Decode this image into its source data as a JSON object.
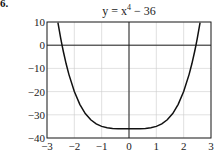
{
  "figure": {
    "label": "6.",
    "title_prefix": "y = x",
    "title_exponent": "4",
    "title_suffix": " − 36"
  },
  "chart_data": {
    "type": "line",
    "xlabel": "",
    "ylabel": "",
    "xlim": [
      -3,
      3
    ],
    "ylim": [
      -40,
      10
    ],
    "xticks": [
      -3,
      -2,
      -1,
      0,
      1,
      2,
      3
    ],
    "yticks": [
      10,
      0,
      -10,
      -20,
      -30,
      -40
    ],
    "xtick_labels": [
      "−3",
      "−2",
      "−1",
      "0",
      "1",
      "2",
      "3"
    ],
    "ytick_labels": [
      "10",
      "0",
      "−10",
      "−20",
      "−30",
      "−40"
    ],
    "grid": true,
    "legend": null,
    "series": [
      {
        "name": "y = x^4 - 36",
        "x": [
          -2.6,
          -2.5,
          -2.45,
          -2.4,
          -2.3,
          -2.2,
          -2.0,
          -1.8,
          -1.6,
          -1.4,
          -1.2,
          -1.0,
          -0.8,
          -0.6,
          -0.4,
          -0.2,
          0,
          0.2,
          0.4,
          0.6,
          0.8,
          1.0,
          1.2,
          1.4,
          1.6,
          1.8,
          2.0,
          2.2,
          2.3,
          2.4,
          2.45,
          2.5,
          2.6
        ],
        "y": [
          9.7,
          3.06,
          0.03,
          -2.82,
          -8.02,
          -12.57,
          -20.0,
          -25.5,
          -29.45,
          -32.16,
          -33.93,
          -35.0,
          -35.59,
          -35.87,
          -35.97,
          -36.0,
          -36.0,
          -36.0,
          -35.97,
          -35.87,
          -35.59,
          -35.0,
          -33.93,
          -32.16,
          -29.45,
          -25.5,
          -20.0,
          -12.57,
          -8.02,
          -2.82,
          0.03,
          3.06,
          9.7
        ]
      }
    ],
    "colors": {
      "curve": "#111111",
      "axes": "#222222",
      "grid": "#cccccc"
    }
  }
}
